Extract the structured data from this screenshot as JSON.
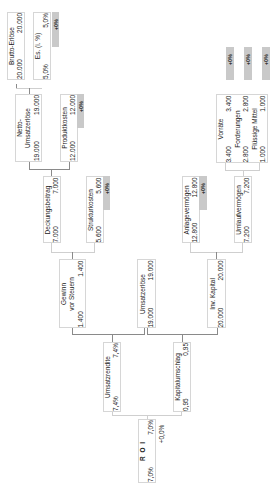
{
  "diagram": {
    "nodes": {
      "brutto_erloese": {
        "label": "Brutto-Erlöse",
        "plan": "20.000",
        "ist": "20.000"
      },
      "es": {
        "label": "Es. (i. %)",
        "plan": "5,0%",
        "ist": "5,0%",
        "delta": "+0%"
      },
      "netto_umsatzerloese": {
        "label1": "Netto-",
        "label2": "Umsatzerlöse",
        "plan": "19.000",
        "ist": "19.000"
      },
      "produktkosten": {
        "label": "Produktkosten",
        "plan": "12.000",
        "ist": "12.000",
        "delta": "+0%"
      },
      "deckungsbeitrag": {
        "label": "Deckungsbeitrag",
        "plan": "7.000",
        "ist": "7.000"
      },
      "strukturkosten": {
        "label": "Strukturkosten",
        "plan": "5.600",
        "ist": "5.600",
        "delta": "+0%"
      },
      "gewinn_vor_steuern": {
        "label1": "Gewinn",
        "label2": "vor Steuern",
        "plan": "1.400",
        "ist": "1.400"
      },
      "umsatzerloese": {
        "label": "Umsatzerlöse",
        "plan": "19.000",
        "ist": "19.000"
      },
      "inv_kapital": {
        "label": "Inv. Kapital",
        "plan": "20.000",
        "ist": "20.000"
      },
      "umsatzrendite": {
        "label": "Umsatzrendite",
        "plan": "7,4%",
        "ist": "7,4%"
      },
      "kapitalumschlag": {
        "label": "Kapitalumschlag",
        "plan": "0,95",
        "ist": "0,95"
      },
      "roi": {
        "label": "R O I",
        "plan": "7,0%",
        "ist": "7,0%",
        "delta": "+0,0%"
      },
      "anlagevermoegen": {
        "label": "Anlagevermögen",
        "plan": "12.800",
        "ist": "12.800",
        "delta": "+0%"
      },
      "umlaufvermoegen": {
        "label": "Umlaufvermögen",
        "plan": "7.200",
        "ist": "7.200"
      },
      "vorraete": {
        "label": "Vorräte",
        "plan": "3.400",
        "ist": "3.400",
        "delta": "+0%"
      },
      "forderungen": {
        "label": "Forderungen",
        "plan": "2.800",
        "ist": "2.800",
        "delta": "+0%"
      },
      "fluessige_mittel": {
        "label": "Flüssige Mittel",
        "plan": "1.000",
        "ist": "1.000",
        "delta": "+0%"
      }
    },
    "colors": {
      "badge": "#c9c9c9",
      "border": "#d6d6d6",
      "connector": "#8a8a8a"
    }
  }
}
